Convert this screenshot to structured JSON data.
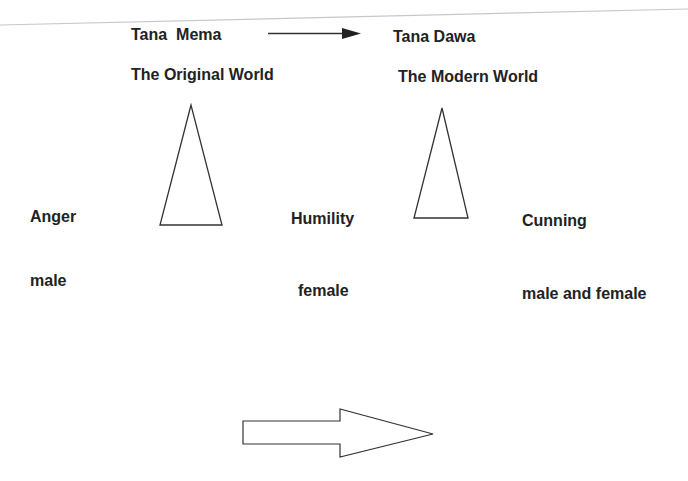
{
  "diagram": {
    "top_left": {
      "name": "Tana  Mema",
      "subtitle": "The Original World"
    },
    "top_right": {
      "name": "Tana Dawa",
      "subtitle": "The Modern World"
    },
    "qualities": [
      {
        "label": "Anger",
        "gender": "male"
      },
      {
        "label": "Humility",
        "gender": "female"
      },
      {
        "label": "Cunning",
        "gender": "male and female"
      }
    ],
    "colors": {
      "text": "#222222",
      "stroke": "#333333",
      "scan_line": "#c8c8c8"
    }
  }
}
